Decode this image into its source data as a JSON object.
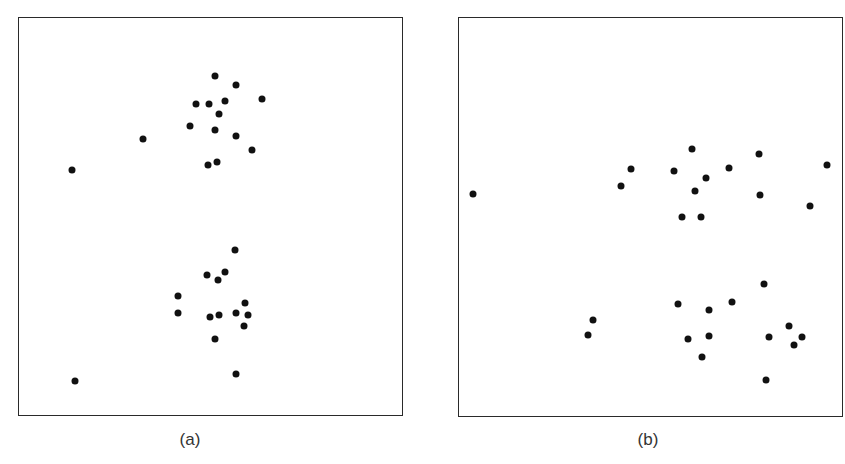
{
  "chart_data": [
    {
      "type": "scatter",
      "panel_label": "(a)",
      "title": "",
      "xlabel": "",
      "ylabel": "",
      "grid": false,
      "legend": null,
      "frame": {
        "left": 18,
        "top": 17,
        "right": 402,
        "bottom": 415
      },
      "description": "Two vertically stacked clusters of points with two isolated outliers at left",
      "points": [
        [
          215,
          76
        ],
        [
          236,
          85
        ],
        [
          262,
          99
        ],
        [
          196,
          104
        ],
        [
          209,
          104
        ],
        [
          225,
          101
        ],
        [
          219,
          114
        ],
        [
          190,
          126
        ],
        [
          215,
          130
        ],
        [
          236,
          136
        ],
        [
          252,
          150
        ],
        [
          143,
          139
        ],
        [
          208,
          165
        ],
        [
          217,
          162
        ],
        [
          72,
          170
        ],
        [
          235,
          250
        ],
        [
          207,
          275
        ],
        [
          225,
          272
        ],
        [
          218,
          280
        ],
        [
          178,
          296
        ],
        [
          178,
          313
        ],
        [
          210,
          317
        ],
        [
          219,
          315
        ],
        [
          236,
          313
        ],
        [
          245,
          303
        ],
        [
          248,
          315
        ],
        [
          244,
          326
        ],
        [
          215,
          339
        ],
        [
          236,
          374
        ],
        [
          75,
          381
        ]
      ]
    },
    {
      "type": "scatter",
      "panel_label": "(b)",
      "title": "",
      "xlabel": "",
      "ylabel": "",
      "grid": false,
      "legend": null,
      "frame": {
        "left": 458,
        "top": 17,
        "right": 842,
        "bottom": 416
      },
      "description": "Two horizontally spread clusters of points with an isolated outlier at left",
      "points": [
        [
          473,
          194
        ],
        [
          631,
          169
        ],
        [
          621,
          186
        ],
        [
          692,
          149
        ],
        [
          674,
          171
        ],
        [
          706,
          178
        ],
        [
          695,
          191
        ],
        [
          682,
          217
        ],
        [
          701,
          217
        ],
        [
          729,
          168
        ],
        [
          759,
          154
        ],
        [
          760,
          195
        ],
        [
          827,
          165
        ],
        [
          810,
          206
        ],
        [
          764,
          284
        ],
        [
          678,
          304
        ],
        [
          732,
          302
        ],
        [
          709,
          310
        ],
        [
          593,
          320
        ],
        [
          588,
          335
        ],
        [
          688,
          339
        ],
        [
          709,
          336
        ],
        [
          769,
          337
        ],
        [
          789,
          326
        ],
        [
          802,
          337
        ],
        [
          794,
          345
        ],
        [
          702,
          357
        ],
        [
          766,
          380
        ]
      ]
    }
  ],
  "captions": {
    "a": "(a)",
    "b": "(b)"
  },
  "colors": {
    "dot": "#111111",
    "frame": "#2a2a2a",
    "caption": "#333333"
  }
}
